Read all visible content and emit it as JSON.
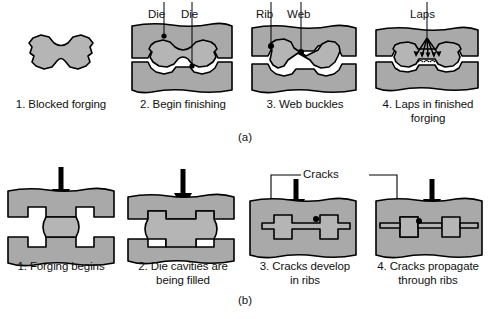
{
  "figure": {
    "title_a": "(a)",
    "title_b": "(b)",
    "colors": {
      "die_fill": "#a9a9a9",
      "workpiece_fill": "#b5b5b5",
      "cavity_fill": "#ffffff",
      "outline": "#000000",
      "background": "#ffffff"
    }
  },
  "sequence_a": {
    "id": "(a)",
    "description": "Web buckling leading to laps in a finished forging",
    "panels": [
      {
        "number": "1.",
        "caption": "1. Blocked forging",
        "annotations": [],
        "shape": "dogbone-blocker"
      },
      {
        "number": "2.",
        "caption": "2. Begin finishing",
        "annotations": [
          "Die",
          "Die"
        ],
        "shape": "dies-closing-on-blocker"
      },
      {
        "number": "3.",
        "caption": "3. Web buckles",
        "annotations": [
          "Rib",
          "Web"
        ],
        "shape": "web-buckled"
      },
      {
        "number": "4.",
        "caption": "4. Laps in finished\nforging",
        "annotations": [
          "Laps"
        ],
        "shape": "laps-formed"
      }
    ]
  },
  "sequence_b": {
    "id": "(b)",
    "description": "Crack development and propagation in forged ribs",
    "shared_annotation": "Cracks",
    "panels": [
      {
        "number": "1.",
        "caption": "1. Forging begins",
        "annotations": [],
        "shape": "dies-open-billet"
      },
      {
        "number": "2.",
        "caption": "2. Die cavities are\nbeing filled",
        "annotations": [],
        "shape": "cavities-filling"
      },
      {
        "number": "3.",
        "caption": "3. Cracks develop\nin ribs",
        "annotations": [
          "Cracks"
        ],
        "shape": "cracks-in-ribs"
      },
      {
        "number": "4.",
        "caption": "4. Cracks propagate\nthrough ribs",
        "annotations": [
          "Cracks"
        ],
        "shape": "cracks-propagated"
      }
    ]
  }
}
